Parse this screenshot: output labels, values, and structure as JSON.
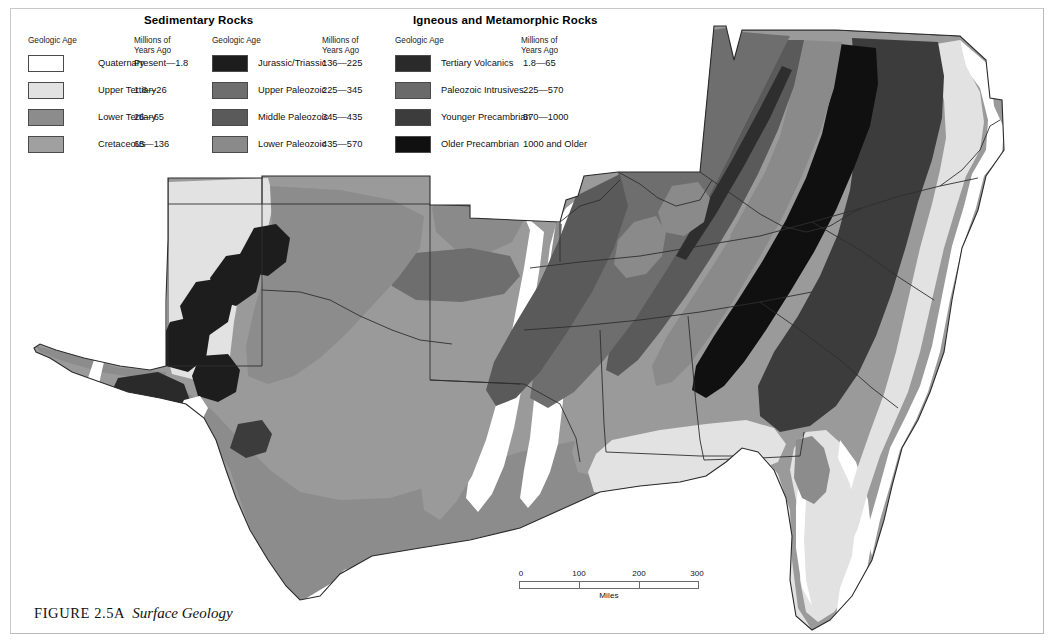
{
  "figure": {
    "label": "FIGURE 2.5A",
    "title": "Surface Geology"
  },
  "legend": {
    "groups": [
      {
        "name": "sedimentary",
        "title": "Sedimentary Rocks",
        "col_age_header": "Geologic Age",
        "col_years_header_line1": "Millions of",
        "col_years_header_line2": "Years Ago",
        "items": [
          {
            "label": "Quaternary",
            "years": "Present—1.8",
            "color": "#ffffff"
          },
          {
            "label": "Upper Tertiary",
            "years": "1.8—26",
            "color": "#e2e2e2"
          },
          {
            "label": "Lower Tertiary",
            "years": "26—65",
            "color": "#8c8c8c"
          },
          {
            "label": "Cretaceous",
            "years": "65—136",
            "color": "#a0a0a0"
          }
        ]
      },
      {
        "name": "sedimentary-2",
        "title": "",
        "col_age_header": "Geologic Age",
        "col_years_header_line1": "Millions of",
        "col_years_header_line2": "Years Ago",
        "items": [
          {
            "label": "Jurassic/Triassic",
            "years": "136—225",
            "color": "#1d1d1d"
          },
          {
            "label": "Upper Paleozoic",
            "years": "225—345",
            "color": "#6e6e6e"
          },
          {
            "label": "Middle Paleozoic",
            "years": "345—435",
            "color": "#5a5a5a"
          },
          {
            "label": "Lower Paleozoic",
            "years": "435—570",
            "color": "#8a8a8a"
          }
        ]
      },
      {
        "name": "igneous",
        "title": "Igneous and Metamorphic Rocks",
        "col_age_header": "Geologic Age",
        "col_years_header_line1": "Millions of",
        "col_years_header_line2": "Years Ago",
        "items": [
          {
            "label": "Tertiary Volcanics",
            "years": "1.8—65",
            "color": "#2a2a2a"
          },
          {
            "label": "Paleozoic Intrusives",
            "years": "225—570",
            "color": "#6a6a6a"
          },
          {
            "label": "Younger Precambrian",
            "years": "570—1000",
            "color": "#3c3c3c"
          },
          {
            "label": "Older Precambrian",
            "years": "1000 and Older",
            "color": "#101010"
          }
        ]
      }
    ]
  },
  "scalebar": {
    "caption": "Miles",
    "ticks": [
      "0",
      "100",
      "200",
      "300"
    ]
  },
  "map": {
    "description": "Surface geology of the southeastern and south-central United States",
    "outline_color": "#2b2b2b",
    "state_border_color": "#3a3a3a"
  }
}
